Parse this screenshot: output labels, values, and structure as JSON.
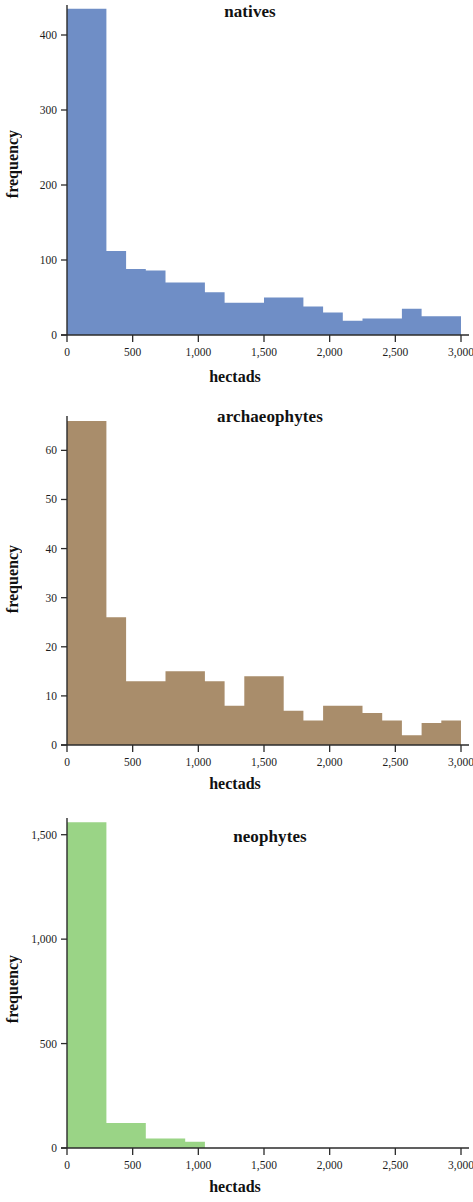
{
  "figure": {
    "panel_count": 3,
    "shared_xlabel": "hectads",
    "shared_ylabel": "frequency"
  },
  "chart_data": [
    {
      "type": "bar",
      "title": "natives",
      "xlabel": "hectads",
      "ylabel": "frequency",
      "color": "#6f8ec6",
      "xlim": [
        0,
        3000
      ],
      "ylim": [
        0,
        440
      ],
      "grid": false,
      "legend": null,
      "bin_width": 150,
      "xticks": [
        0,
        500,
        1000,
        1500,
        2000,
        2500,
        3000
      ],
      "xticklabels": [
        "0",
        "500",
        "1,000",
        "1,500",
        "2,000",
        "2,500",
        "3,000"
      ],
      "yticks": [
        0,
        100,
        200,
        300,
        400
      ],
      "yticklabels": [
        "0",
        "100",
        "200",
        "300",
        "400"
      ],
      "bin_starts": [
        0,
        150,
        300,
        450,
        600,
        750,
        900,
        1050,
        1200,
        1350,
        1500,
        1650,
        1800,
        1950,
        2100,
        2250,
        2400,
        2550,
        2700,
        2850
      ],
      "values": [
        435,
        435,
        112,
        88,
        86,
        70,
        70,
        57,
        43,
        43,
        50,
        50,
        38,
        30,
        19,
        22,
        22,
        35,
        25,
        25,
        215
      ]
    },
    {
      "type": "bar",
      "title": "archaeophytes",
      "xlabel": "hectads",
      "ylabel": "frequency",
      "color": "#a98d6b",
      "xlim": [
        0,
        3000
      ],
      "ylim": [
        0,
        67
      ],
      "grid": false,
      "legend": null,
      "bin_width": 150,
      "xticks": [
        0,
        500,
        1000,
        1500,
        2000,
        2500,
        3000
      ],
      "xticklabels": [
        "0",
        "500",
        "1,000",
        "1,500",
        "2,000",
        "2,500",
        "3,000"
      ],
      "yticks": [
        0,
        10,
        20,
        30,
        40,
        50,
        60
      ],
      "yticklabels": [
        "0",
        "10",
        "20",
        "30",
        "40",
        "50",
        "60"
      ],
      "bin_starts": [
        0,
        150,
        300,
        450,
        600,
        750,
        900,
        1050,
        1200,
        1350,
        1500,
        1650,
        1800,
        1950,
        2100,
        2250,
        2400,
        2550,
        2700,
        2850
      ],
      "values": [
        66,
        66,
        26,
        13,
        13,
        15,
        15,
        13,
        8,
        14,
        14,
        7,
        5,
        8,
        8,
        6.5,
        5,
        2,
        4.5,
        5,
        5
      ]
    },
    {
      "type": "bar",
      "title": "neophytes",
      "xlabel": "hectads",
      "ylabel": "frequency",
      "color": "#9ad486",
      "xlim": [
        0,
        3000
      ],
      "ylim": [
        0,
        1580
      ],
      "grid": false,
      "legend": null,
      "bin_width": 150,
      "xticks": [
        0,
        500,
        1000,
        1500,
        2000,
        2500,
        3000
      ],
      "xticklabels": [
        "0",
        "500",
        "1,000",
        "1,500",
        "2,000",
        "2,500",
        "3,000"
      ],
      "yticks": [
        0,
        500,
        1000,
        1500
      ],
      "yticklabels": [
        "0",
        "500",
        "1,000",
        "1,500"
      ],
      "bin_starts": [
        0,
        150,
        300,
        450,
        600,
        750,
        900,
        1050,
        1200,
        1350,
        1500,
        1650,
        1800,
        1950,
        2100,
        2250,
        2400,
        2550,
        2700,
        2850
      ],
      "values": [
        1560,
        1560,
        120,
        120,
        45,
        45,
        30,
        0,
        0,
        0,
        0,
        0,
        0,
        0,
        0,
        0,
        0,
        0,
        0,
        0,
        0
      ]
    }
  ]
}
